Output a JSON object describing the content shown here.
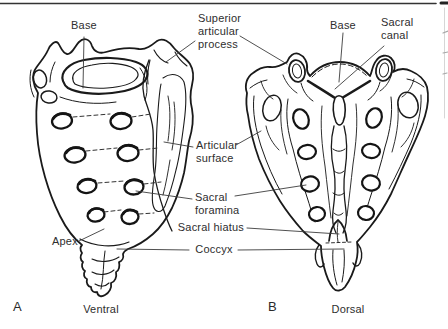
{
  "figure": {
    "labels": {
      "base_ventral": "Base",
      "superior_articular_process": "Superior articular process",
      "base_dorsal": "Base",
      "sacral_canal": "Sacral canal",
      "articular_surface": "Articular surface",
      "sacral_foramina": "Sacral foramina",
      "sacral_hiatus": "Sacral hiatus",
      "coccyx": "Coccyx",
      "apex": "Apex"
    },
    "panels": [
      {
        "letter": "A",
        "caption": "Ventral"
      },
      {
        "letter": "B",
        "caption": "Dorsal"
      }
    ]
  }
}
